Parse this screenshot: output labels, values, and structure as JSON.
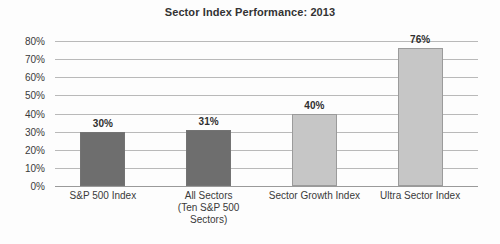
{
  "chart_data": {
    "type": "bar",
    "title": "Sector Index Performance: 2013",
    "xlabel": "",
    "ylabel": "",
    "ylim": [
      0,
      80
    ],
    "grid": "horizontal",
    "legend": "none",
    "categories": [
      "S&P 500 Index",
      "All Sectors (Ten S&P 500 Sectors)",
      "Sector Growth Index",
      "Ultra Sector Index"
    ],
    "category_lines": [
      [
        "S&P 500 Index"
      ],
      [
        "All Sectors",
        "(Ten S&P 500",
        "Sectors)"
      ],
      [
        "Sector Growth Index"
      ],
      [
        "Ultra Sector Index"
      ]
    ],
    "values": [
      30,
      31,
      40,
      76
    ],
    "value_labels": [
      "30%",
      "31%",
      "40%",
      "76%"
    ],
    "bar_colors": [
      "#6e6e6e",
      "#6e6e6e",
      "#c6c6c6",
      "#c6c6c6"
    ],
    "y_ticks": [
      0,
      10,
      20,
      30,
      40,
      50,
      60,
      70,
      80
    ],
    "y_tick_labels": [
      "0%",
      "10%",
      "20%",
      "30%",
      "40%",
      "50%",
      "60%",
      "70%",
      "80%"
    ]
  },
  "colors": {
    "dark_bar": "#6e6e6e",
    "light_bar": "#c6c6c6",
    "gridline": "#b9b9b9",
    "text": "#3a3a3a",
    "background": "#fdfdfd"
  }
}
